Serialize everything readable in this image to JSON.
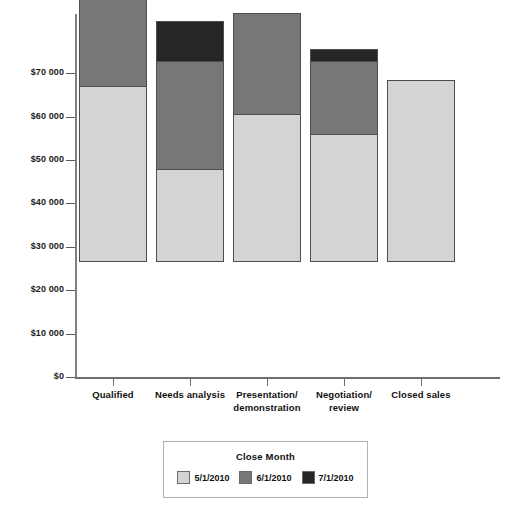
{
  "chart_data": {
    "type": "bar",
    "subtype": "stacked-bar",
    "title": "",
    "xlabel": "",
    "ylabel": "",
    "categories": [
      "Qualified",
      "Needs analysis",
      "Presentation/demonstration",
      "Negotiation/review",
      "Closed sales"
    ],
    "category_lines": [
      [
        "Qualified"
      ],
      [
        "Needs analysis"
      ],
      [
        "Presentation/",
        "demonstration"
      ],
      [
        "Negotiation/",
        "review"
      ],
      [
        "Closed sales"
      ]
    ],
    "series": [
      {
        "name": "5/1/2010",
        "color": "#d4d4d4",
        "values": [
          40500,
          21500,
          34000,
          29500,
          42000
        ]
      },
      {
        "name": "6/1/2010",
        "color": "#777777",
        "values": [
          22500,
          25000,
          23500,
          17000,
          0
        ]
      },
      {
        "name": "7/1/2010",
        "color": "#262626",
        "values": [
          17500,
          9500,
          0,
          3000,
          0
        ]
      }
    ],
    "totals": [
      80500,
      56000,
      57500,
      49500,
      42000
    ],
    "ylim": [
      0,
      80900
    ],
    "ytick_values": [
      0,
      10000,
      20000,
      30000,
      40000,
      50000,
      60000,
      70000
    ],
    "ytick_labels": [
      "$0",
      "$10 000",
      "$20 000",
      "$30 000",
      "$40 000",
      "$50 000",
      "$60 000",
      "$70 000"
    ],
    "grid": false,
    "legend_position": "bottom-center"
  },
  "legend": {
    "title": "Close Month",
    "items": [
      {
        "label": "5/1/2010",
        "color": "#d4d4d4"
      },
      {
        "label": "6/1/2010",
        "color": "#777777"
      },
      {
        "label": "7/1/2010",
        "color": "#262626"
      }
    ]
  },
  "colors": {
    "background": "#ffffff",
    "axis": "#6e6e6e",
    "text": "#111111",
    "series_5_1_2010": "#d4d4d4",
    "series_6_1_2010": "#777777",
    "series_7_1_2010": "#262626"
  }
}
